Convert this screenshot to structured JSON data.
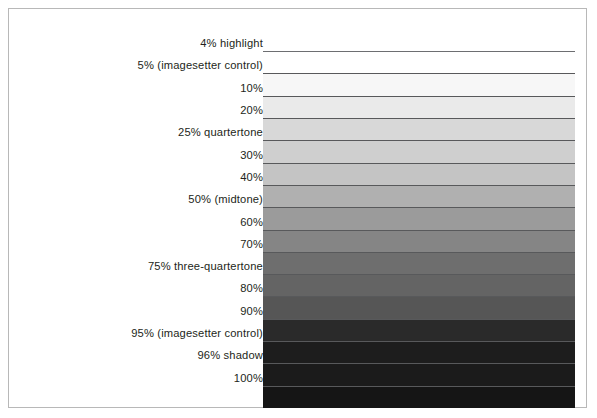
{
  "figure": {
    "name": "tint-scale-chart",
    "frame_color": "#b8b8b8",
    "background": "#ffffff",
    "label_color": "#231f20",
    "rule_color": "#58595b"
  },
  "chart_data": {
    "type": "bar",
    "xlabel": "",
    "ylabel": "Tint value",
    "orientation": "horizontal-bands",
    "grid": false,
    "legend": false,
    "categories": [
      "4% highlight",
      "5% (imagesetter control)",
      "10%",
      "20%",
      "25% quartertone",
      "30%",
      "40%",
      "50% (midtone)",
      "60%",
      "70%",
      "75% three-quartertone",
      "80%",
      "90%",
      "95% (imagesetter control)",
      "96% shadow",
      "100%"
    ],
    "values": [
      4,
      5,
      10,
      20,
      25,
      30,
      40,
      50,
      60,
      70,
      75,
      80,
      90,
      95,
      96,
      100
    ],
    "value_unit": "%",
    "ylim": [
      0,
      100
    ],
    "swatch_colors": [
      "#ffffff",
      "#f7f7f7",
      "#eaeaea",
      "#d8d8d8",
      "#cfcfcf",
      "#c4c4c4",
      "#b0b0b0",
      "#9b9b9b",
      "#858585",
      "#6e6e6e",
      "#646464",
      "#565656",
      "#2a2a2a",
      "#1d1d1d",
      "#1b1b1b",
      "#151515"
    ]
  },
  "rows": [
    {
      "label": "4% highlight",
      "percent": 4,
      "color": "#ffffff"
    },
    {
      "label": "5% (imagesetter control)",
      "percent": 5,
      "color": "#f7f7f7"
    },
    {
      "label": "10%",
      "percent": 10,
      "color": "#eaeaea"
    },
    {
      "label": "20%",
      "percent": 20,
      "color": "#d8d8d8"
    },
    {
      "label": "25% quartertone",
      "percent": 25,
      "color": "#cfcfcf"
    },
    {
      "label": "30%",
      "percent": 30,
      "color": "#c4c4c4"
    },
    {
      "label": "40%",
      "percent": 40,
      "color": "#b0b0b0"
    },
    {
      "label": "50% (midtone)",
      "percent": 50,
      "color": "#9b9b9b"
    },
    {
      "label": "60%",
      "percent": 60,
      "color": "#858585"
    },
    {
      "label": "70%",
      "percent": 70,
      "color": "#6e6e6e"
    },
    {
      "label": "75% three-quartertone",
      "percent": 75,
      "color": "#646464"
    },
    {
      "label": "80%",
      "percent": 80,
      "color": "#565656"
    },
    {
      "label": "90%",
      "percent": 90,
      "color": "#2a2a2a"
    },
    {
      "label": "95% (imagesetter control)",
      "percent": 95,
      "color": "#1d1d1d"
    },
    {
      "label": "96% shadow",
      "percent": 96,
      "color": "#1b1b1b"
    },
    {
      "label": "100%",
      "percent": 100,
      "color": "#151515"
    }
  ]
}
